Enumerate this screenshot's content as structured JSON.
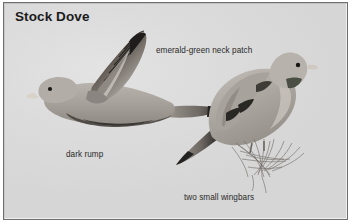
{
  "plate": {
    "title": "Stock Dove",
    "background_color": "#d9d9d9",
    "frame_color": "#6e6e6e",
    "text_color": "#2a2a2a"
  },
  "captions": {
    "neck_patch": "emerald-green neck patch",
    "rump": "dark rump",
    "wingbars": "two small wingbars"
  },
  "illustrations": {
    "flying_bird": "stock-dove-in-flight",
    "perched_bird": "stock-dove-perched",
    "perch": "twig-branch-sketch"
  }
}
